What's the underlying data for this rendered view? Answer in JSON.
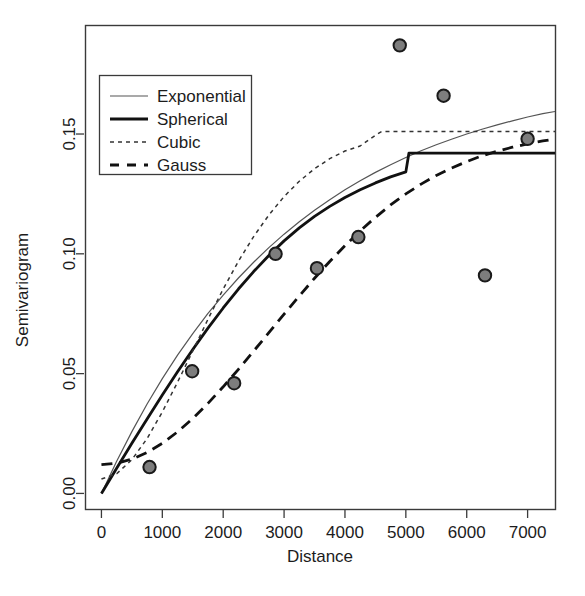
{
  "chart_data": {
    "type": "scatter",
    "title": "",
    "subtitle": "",
    "xlabel": "Distance",
    "ylabel": "Semivariogram",
    "xlim": [
      -270,
      7450
    ],
    "ylim": [
      -0.0065,
      0.1955
    ],
    "grid": false,
    "legend_position": "top-left",
    "xticks": [
      0,
      1000,
      2000,
      3000,
      4000,
      5000,
      6000,
      7000
    ],
    "xtick_labels": [
      "0",
      "1000",
      "2000",
      "3000",
      "4000",
      "5000",
      "6000",
      "7000"
    ],
    "yticks": [
      0.0,
      0.05,
      0.1,
      0.15
    ],
    "ytick_labels": [
      "0.00",
      "0.05",
      "0.10",
      "0.15"
    ],
    "points": {
      "name": "Empirical semivariogram",
      "marker": "filled-circle",
      "marker_fill": "#7d7d7d",
      "marker_edge": "#1a1a1a",
      "x": [
        790,
        1490,
        2180,
        2860,
        3540,
        4220,
        4900,
        5620,
        6300,
        7000
      ],
      "y": [
        0.011,
        0.051,
        0.046,
        0.1,
        0.094,
        0.107,
        0.187,
        0.166,
        0.091,
        0.148
      ]
    },
    "series": [
      {
        "name": "Exponential",
        "model": "exponential",
        "style": "solid-thin",
        "color": "#555555",
        "nugget": 0.0,
        "sill": 0.175,
        "range": 3050,
        "x": [
          0,
          250,
          500,
          750,
          1000,
          1250,
          1500,
          1750,
          2000,
          2250,
          2500,
          2750,
          3000,
          3250,
          3500,
          3750,
          4000,
          4250,
          4500,
          4750,
          5000,
          5250,
          5500,
          5750,
          6000,
          6250,
          6500,
          6750,
          7000,
          7250,
          7450
        ],
        "y": [
          0.0,
          0.0134,
          0.0258,
          0.0373,
          0.0479,
          0.0577,
          0.0667,
          0.0751,
          0.0828,
          0.0899,
          0.0965,
          0.1026,
          0.1082,
          0.1134,
          0.1182,
          0.1226,
          0.1267,
          0.1305,
          0.134,
          0.1372,
          0.1402,
          0.143,
          0.1455,
          0.1478,
          0.15,
          0.152,
          0.1538,
          0.1555,
          0.1571,
          0.1585,
          0.1594
        ]
      },
      {
        "name": "Spherical",
        "model": "spherical",
        "style": "solid-thick",
        "color": "#111111",
        "nugget": 0.0,
        "sill": 0.142,
        "range": 5050,
        "x": [
          0,
          250,
          500,
          750,
          1000,
          1250,
          1500,
          1750,
          2000,
          2250,
          2500,
          2750,
          3000,
          3250,
          3500,
          3750,
          4000,
          4250,
          4500,
          4750,
          5000,
          5050,
          5500,
          6000,
          6500,
          7000,
          7450
        ],
        "y": [
          0.0,
          0.0105,
          0.0209,
          0.0311,
          0.0411,
          0.0508,
          0.0601,
          0.069,
          0.0774,
          0.0853,
          0.0926,
          0.0993,
          0.1054,
          0.1108,
          0.1156,
          0.1198,
          0.1235,
          0.1267,
          0.1296,
          0.1321,
          0.1342,
          0.142,
          0.142,
          0.142,
          0.142,
          0.142,
          0.142
        ]
      },
      {
        "name": "Cubic",
        "model": "cubic",
        "style": "dotted",
        "color": "#333333",
        "nugget": 0.006,
        "sill": 0.151,
        "range": 4600,
        "x": [
          0,
          250,
          500,
          750,
          1000,
          1250,
          1500,
          1750,
          2000,
          2250,
          2500,
          2750,
          3000,
          3250,
          3500,
          3750,
          4000,
          4250,
          4500,
          4600,
          5000,
          5500,
          6000,
          6500,
          7000,
          7450
        ],
        "y": [
          0.006,
          0.0082,
          0.0141,
          0.0229,
          0.034,
          0.0464,
          0.0595,
          0.0727,
          0.0853,
          0.0969,
          0.1072,
          0.1162,
          0.1239,
          0.1303,
          0.1355,
          0.1397,
          0.1429,
          0.145,
          0.1495,
          0.151,
          0.151,
          0.151,
          0.151,
          0.151,
          0.151,
          0.151
        ]
      },
      {
        "name": "Gauss",
        "model": "gaussian",
        "style": "dashed",
        "color": "#111111",
        "nugget": 0.012,
        "sill": 0.162,
        "range": 4000,
        "x": [
          0,
          250,
          500,
          750,
          1000,
          1250,
          1500,
          1750,
          2000,
          2250,
          2500,
          2750,
          3000,
          3250,
          3500,
          3750,
          4000,
          4250,
          4500,
          4750,
          5000,
          5250,
          5500,
          5750,
          6000,
          6250,
          6500,
          6750,
          7000,
          7250,
          7450
        ],
        "y": [
          0.012,
          0.0126,
          0.0143,
          0.0171,
          0.0209,
          0.0257,
          0.0313,
          0.0376,
          0.0445,
          0.0518,
          0.0594,
          0.0671,
          0.0748,
          0.0824,
          0.0898,
          0.0968,
          0.1034,
          0.1096,
          0.1152,
          0.1204,
          0.125,
          0.1291,
          0.1327,
          0.1358,
          0.1385,
          0.1409,
          0.1428,
          0.1445,
          0.1459,
          0.1471,
          0.1479
        ]
      }
    ],
    "legend_entries": [
      {
        "label": "Exponential",
        "style": "solid-thin"
      },
      {
        "label": "Spherical",
        "style": "solid-thick"
      },
      {
        "label": "Cubic",
        "style": "dotted"
      },
      {
        "label": "Gauss",
        "style": "dashed"
      }
    ]
  }
}
